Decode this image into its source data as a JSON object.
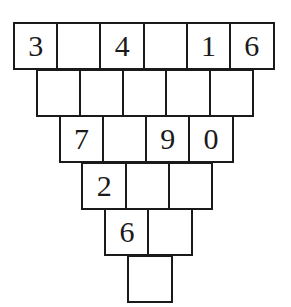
{
  "puzzle": {
    "type": "inverted-number-pyramid",
    "rows": [
      [
        "3",
        "",
        "4",
        "",
        "1",
        "6"
      ],
      [
        "",
        "",
        "",
        "",
        ""
      ],
      [
        "7",
        "",
        "9",
        "0"
      ],
      [
        "2",
        "",
        ""
      ],
      [
        "6",
        ""
      ],
      [
        ""
      ]
    ]
  }
}
